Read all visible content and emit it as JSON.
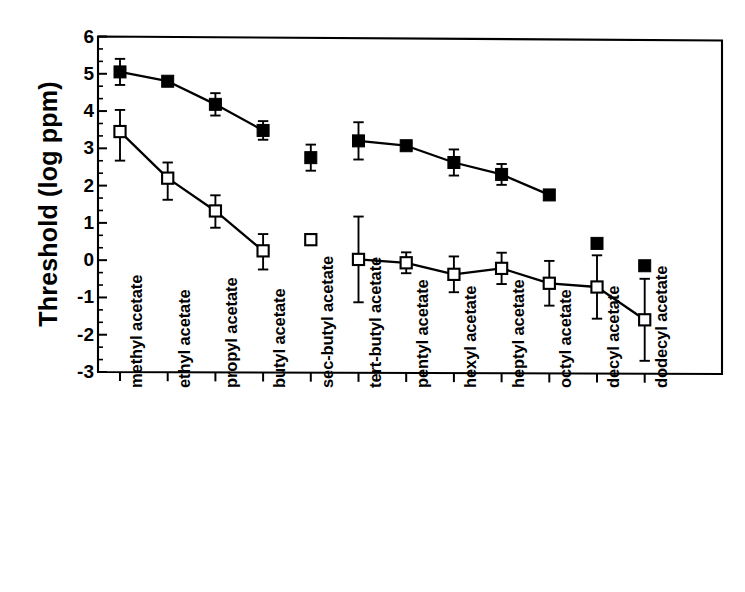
{
  "chart_data": {
    "type": "scatter",
    "title": "",
    "xlabel": "",
    "ylabel": "Threshold (log ppm)",
    "ylim": [
      -3,
      6
    ],
    "yticks": [
      6,
      5,
      4,
      3,
      2,
      1,
      0,
      "-1",
      "-2",
      "-3"
    ],
    "ytick_values": [
      6,
      5,
      4,
      3,
      2,
      1,
      0,
      -1,
      -2,
      -3
    ],
    "grid": false,
    "legend": "none",
    "minor_ticks_per_interval": 2,
    "categories": [
      "methyl acetate",
      "ethyl acetate",
      "propyl acetate",
      "butyl acetate",
      "sec-butyl acetate",
      "tert-butyl acetate",
      "pentyl acetate",
      "hexyl acetate",
      "heptyl acetate",
      "octyl acetate",
      "decyl acetate",
      "dodecyl acetate"
    ],
    "series": [
      {
        "name": "filled-square-series",
        "marker": "filled-square",
        "connected": true,
        "values": [
          5.05,
          4.8,
          4.18,
          3.48,
          2.75,
          3.2,
          3.07,
          2.62,
          2.3,
          1.75,
          0.45,
          -0.15
        ],
        "err_low": [
          0.35,
          0.1,
          0.3,
          0.25,
          0.35,
          0.5,
          0.1,
          0.35,
          0.28,
          null,
          null,
          null
        ],
        "err_high": [
          0.35,
          0.1,
          0.3,
          0.25,
          0.35,
          0.5,
          0.1,
          0.35,
          0.28,
          null,
          null,
          null
        ],
        "line_break_after_index": 3,
        "line_resume_at_index": 5,
        "line_end_index": 9,
        "detached_points": [
          4,
          10,
          11
        ]
      },
      {
        "name": "open-square-series",
        "marker": "open-square",
        "connected": true,
        "values": [
          3.45,
          2.2,
          1.32,
          0.25,
          0.55,
          0.02,
          -0.07,
          -0.38,
          -0.22,
          -0.62,
          -0.72,
          -1.6
        ],
        "err_low": [
          0.78,
          0.58,
          0.45,
          0.5,
          0.12,
          1.15,
          0.28,
          0.48,
          0.42,
          0.6,
          0.85,
          1.1
        ],
        "err_high": [
          0.58,
          0.42,
          0.42,
          0.45,
          0.12,
          1.15,
          0.28,
          0.48,
          0.42,
          0.6,
          0.85,
          1.1
        ],
        "line_break_after_index": 3,
        "line_resume_at_index": 5,
        "detached_points": [
          4
        ]
      }
    ]
  },
  "axis": {
    "y_title": "Threshold (log ppm)"
  }
}
